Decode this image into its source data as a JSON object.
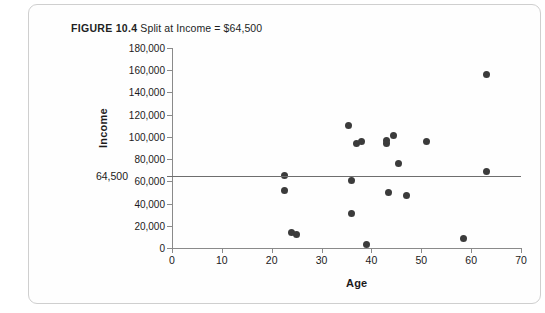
{
  "figure": {
    "label": "FIGURE 10.4",
    "caption": "Split at Income = $64,500"
  },
  "chart_data": {
    "type": "scatter",
    "title": "FIGURE 10.4  Split at Income = $64,500",
    "xlabel": "Age",
    "ylabel": "Income",
    "xlim": [
      0,
      70
    ],
    "ylim": [
      0,
      180000
    ],
    "xticks": [
      0,
      10,
      20,
      30,
      40,
      50,
      60,
      70
    ],
    "xtick_labels": [
      "0",
      "10",
      "20",
      "30",
      "40",
      "50",
      "60",
      "70"
    ],
    "yticks": [
      0,
      20000,
      40000,
      60000,
      80000,
      100000,
      120000,
      140000,
      160000,
      180000
    ],
    "ytick_labels": [
      "0",
      "20,000",
      "40,000",
      "60,000",
      "80,000",
      "100,000",
      "120,000",
      "140,000",
      "160,000",
      "180,000"
    ],
    "grid": false,
    "legend": false,
    "marker_color": "#3b3b3b",
    "reference_line": {
      "orientation": "horizontal",
      "value": 64500,
      "label": "64,500",
      "color": "#6e6e6e"
    },
    "points": [
      {
        "x": 22.5,
        "y": 65500
      },
      {
        "x": 22.5,
        "y": 51500
      },
      {
        "x": 24.0,
        "y": 14000
      },
      {
        "x": 25.0,
        "y": 12000
      },
      {
        "x": 35.5,
        "y": 110000
      },
      {
        "x": 36.0,
        "y": 60500
      },
      {
        "x": 36.0,
        "y": 31000
      },
      {
        "x": 37.0,
        "y": 94500
      },
      {
        "x": 38.0,
        "y": 95500
      },
      {
        "x": 39.0,
        "y": 3500
      },
      {
        "x": 43.0,
        "y": 94000
      },
      {
        "x": 43.0,
        "y": 97000
      },
      {
        "x": 43.5,
        "y": 50000
      },
      {
        "x": 44.5,
        "y": 101000
      },
      {
        "x": 45.5,
        "y": 76000
      },
      {
        "x": 47.0,
        "y": 47000
      },
      {
        "x": 51.0,
        "y": 95500
      },
      {
        "x": 58.5,
        "y": 9000
      },
      {
        "x": 63.0,
        "y": 68500
      },
      {
        "x": 63.0,
        "y": 156000
      }
    ]
  }
}
